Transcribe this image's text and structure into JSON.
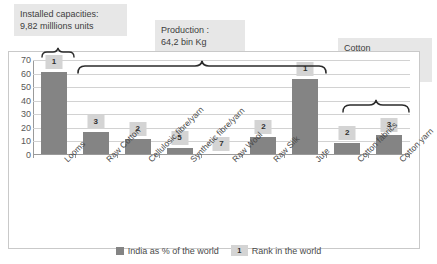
{
  "chart_data": {
    "type": "bar",
    "title": "",
    "xlabel": "",
    "ylabel": "",
    "ylim": [
      0,
      70
    ],
    "yticks": [
      70,
      60,
      50,
      40,
      30,
      20,
      10,
      0
    ],
    "grid": true,
    "legend_position": "bottom",
    "categories": [
      "Looms",
      "Raw Cotton",
      "Cellulosic fibre/yarn",
      "Synthetic fibre/yarn",
      "Raw Wool",
      "Raw Silk",
      "Jute",
      "Cotton fabrics",
      "Cotton yarn"
    ],
    "series": [
      {
        "name": "India as % of the world",
        "values": [
          61,
          17,
          12,
          5,
          1,
          13,
          56,
          9,
          15
        ]
      }
    ],
    "point_labels": {
      "name": "Rank in the world",
      "values": [
        "1",
        "3",
        "2",
        "5",
        "7",
        "2",
        "1",
        "2",
        "3"
      ]
    },
    "annotations": [
      {
        "id": "installed-capacities",
        "text": "Installed capacities:\n9,82 milllions units",
        "covers": [
          "Looms"
        ]
      },
      {
        "id": "production",
        "text": "Production :\n64,2 bin Kg",
        "covers": [
          "Raw Cotton",
          "Cellulosic fibre/yarn",
          "Synthetic fibre/yarn",
          "Raw Wool",
          "Raw Silk",
          "Jute"
        ]
      },
      {
        "id": "cotton-production",
        "text": "Cotton\nproduction:\n39 Bn Kg",
        "covers": [
          "Cotton fabrics",
          "Cotton yarn"
        ]
      }
    ],
    "colors": {
      "bar": "#848484",
      "rank_badge": "#d4d4d4",
      "callout_background": "#e7e7e7",
      "gridline": "#d2d2d2",
      "frame": "#c9c9c9",
      "text": "#4a4a4a"
    }
  },
  "legend": {
    "series_label": "India as % of the world",
    "rank_sample": "1",
    "rank_label": "Rank in the world"
  }
}
